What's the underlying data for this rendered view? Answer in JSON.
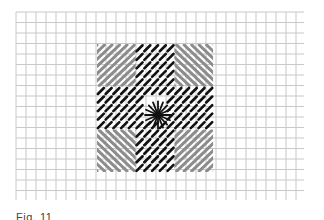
{
  "diagram": {
    "type": "needlepoint-stitch-chart",
    "grid": {
      "x_start": 16,
      "x_end": 304,
      "x_step": 10,
      "y_start": 12,
      "y_end": 200,
      "y_step": 10.5,
      "line_color": "#c8c8c8"
    },
    "pattern": {
      "x": 97,
      "y": 44,
      "block_w": 38.7,
      "block_h": 42.7,
      "blocks": [
        {
          "row": 0,
          "col": 0,
          "style": "grey-diagonal",
          "direction": "up-right"
        },
        {
          "row": 0,
          "col": 1,
          "style": "black-tent",
          "direction": "up-right"
        },
        {
          "row": 0,
          "col": 2,
          "style": "grey-diagonal",
          "direction": "down-right"
        },
        {
          "row": 1,
          "col": 0,
          "style": "black-tent",
          "direction": "up-right"
        },
        {
          "row": 1,
          "col": 1,
          "style": "star-eye",
          "direction": "radial"
        },
        {
          "row": 1,
          "col": 2,
          "style": "black-tent",
          "direction": "up-right"
        },
        {
          "row": 2,
          "col": 0,
          "style": "grey-diagonal",
          "direction": "down-right"
        },
        {
          "row": 2,
          "col": 1,
          "style": "black-tent",
          "direction": "up-right"
        },
        {
          "row": 2,
          "col": 2,
          "style": "grey-diagonal",
          "direction": "up-right"
        }
      ],
      "colors": {
        "grey_stitch": "#8c8c8c",
        "black_stitch": "#111111"
      },
      "center": {
        "x": 158,
        "y": 115,
        "rays": 16
      }
    },
    "caption": "Fig. 11"
  }
}
